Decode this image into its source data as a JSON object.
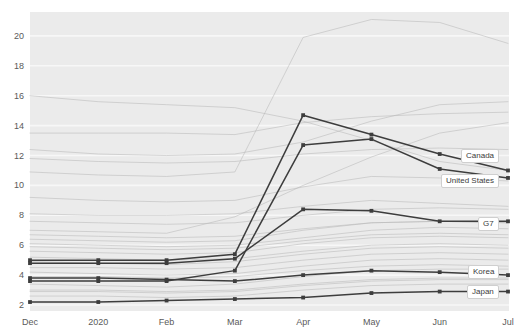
{
  "chart_data": {
    "type": "line",
    "title": "",
    "xlabel": "",
    "ylabel": "",
    "x": [
      "Dec",
      "2020",
      "Feb",
      "Mar",
      "Apr",
      "May",
      "Jun",
      "Jul"
    ],
    "xtick_labels": [
      "Dec",
      "2020",
      "Feb",
      "Mar",
      "Apr",
      "May",
      "Jun",
      "Jul"
    ],
    "ytick_labels": [
      "2",
      "4",
      "6",
      "8",
      "10",
      "12",
      "14",
      "16",
      "18",
      "20"
    ],
    "ytick_values": [
      2,
      4,
      6,
      8,
      10,
      12,
      14,
      16,
      18,
      20
    ],
    "ylim": [
      1.6,
      21.6
    ],
    "xlim": [
      0,
      7
    ],
    "grid": true,
    "grid_color": "#f7f7f7",
    "plot_background": "#ebebeb",
    "legend_position": "end-of-line",
    "highlight_color": "#3d3d3d",
    "context_color": "#b9b9b9",
    "series": [
      {
        "name": "Canada",
        "highlight": true,
        "label": "Canada",
        "label_y": 12.0,
        "values": [
          5.0,
          5.0,
          5.0,
          5.4,
          14.7,
          13.4,
          12.1,
          11.0
        ]
      },
      {
        "name": "United States",
        "highlight": true,
        "label": "United States",
        "label_y": 10.3,
        "values": [
          3.6,
          3.6,
          3.6,
          4.3,
          12.7,
          13.1,
          11.1,
          10.5
        ]
      },
      {
        "name": "G7",
        "highlight": true,
        "label": "G7",
        "label_y": 7.4,
        "values": [
          4.8,
          4.8,
          4.8,
          5.1,
          8.4,
          8.3,
          7.6,
          7.6
        ]
      },
      {
        "name": "Korea",
        "highlight": true,
        "label": "Korea",
        "label_y": 4.2,
        "values": [
          3.8,
          3.8,
          3.7,
          3.6,
          4.0,
          4.3,
          4.2,
          4.0
        ]
      },
      {
        "name": "Japan",
        "highlight": true,
        "label": "Japan",
        "label_y": 2.9,
        "values": [
          2.2,
          2.2,
          2.3,
          2.4,
          2.5,
          2.8,
          2.9,
          2.9
        ]
      },
      {
        "name": "context-01",
        "highlight": false,
        "values": [
          16.0,
          15.6,
          15.4,
          15.2,
          14.3,
          13.0,
          11.6,
          11.0
        ]
      },
      {
        "name": "context-02",
        "highlight": false,
        "values": [
          13.5,
          13.5,
          13.5,
          13.4,
          14.2,
          14.6,
          14.8,
          14.9
        ]
      },
      {
        "name": "context-03",
        "highlight": false,
        "values": [
          12.4,
          12.1,
          12.0,
          12.1,
          12.9,
          14.3,
          15.4,
          15.6
        ]
      },
      {
        "name": "context-04",
        "highlight": false,
        "values": [
          10.9,
          10.7,
          10.6,
          10.9,
          19.9,
          21.1,
          20.9,
          19.5
        ]
      },
      {
        "name": "context-05",
        "highlight": false,
        "values": [
          9.2,
          9.0,
          8.9,
          9.0,
          9.9,
          10.6,
          10.5,
          10.3
        ]
      },
      {
        "name": "context-06",
        "highlight": false,
        "values": [
          8.1,
          8.0,
          8.0,
          8.1,
          8.6,
          9.0,
          8.8,
          8.6
        ]
      },
      {
        "name": "context-07",
        "highlight": false,
        "values": [
          7.0,
          6.9,
          6.8,
          7.9,
          10.0,
          11.9,
          13.5,
          14.2
        ]
      },
      {
        "name": "context-08",
        "highlight": false,
        "values": [
          6.4,
          6.3,
          6.2,
          6.3,
          7.0,
          7.5,
          7.6,
          7.5
        ]
      },
      {
        "name": "context-09",
        "highlight": false,
        "values": [
          6.1,
          6.0,
          5.9,
          6.0,
          6.5,
          7.0,
          7.2,
          7.1
        ]
      },
      {
        "name": "context-10",
        "highlight": false,
        "values": [
          5.6,
          5.5,
          5.4,
          5.5,
          6.1,
          6.5,
          6.6,
          6.5
        ]
      },
      {
        "name": "context-11",
        "highlight": false,
        "values": [
          5.2,
          5.1,
          5.0,
          5.1,
          5.6,
          6.0,
          6.1,
          6.0
        ]
      },
      {
        "name": "context-12",
        "highlight": false,
        "values": [
          4.5,
          4.5,
          4.4,
          4.5,
          5.0,
          5.4,
          5.5,
          5.4
        ]
      },
      {
        "name": "context-13",
        "highlight": false,
        "values": [
          4.2,
          4.1,
          4.0,
          4.1,
          4.6,
          5.0,
          5.1,
          5.0
        ]
      },
      {
        "name": "context-14",
        "highlight": false,
        "values": [
          3.9,
          3.9,
          3.8,
          3.9,
          4.3,
          4.6,
          4.7,
          4.6
        ]
      },
      {
        "name": "context-15",
        "highlight": false,
        "values": [
          3.4,
          3.3,
          3.2,
          3.4,
          3.9,
          4.3,
          4.4,
          4.4
        ]
      },
      {
        "name": "context-16",
        "highlight": false,
        "values": [
          3.0,
          3.0,
          2.9,
          3.0,
          3.4,
          3.7,
          3.8,
          3.8
        ]
      },
      {
        "name": "context-17",
        "highlight": false,
        "values": [
          2.6,
          2.6,
          2.5,
          2.6,
          3.0,
          3.3,
          3.4,
          3.4
        ]
      },
      {
        "name": "context-18",
        "highlight": false,
        "values": [
          4.9,
          4.8,
          4.7,
          4.9,
          5.4,
          5.8,
          5.9,
          5.8
        ]
      },
      {
        "name": "context-19",
        "highlight": false,
        "values": [
          7.6,
          7.5,
          7.4,
          7.5,
          8.0,
          8.4,
          8.5,
          8.4
        ]
      },
      {
        "name": "context-20",
        "highlight": false,
        "values": [
          11.8,
          11.6,
          11.5,
          11.6,
          12.1,
          12.4,
          12.5,
          12.4
        ]
      },
      {
        "name": "context-21",
        "highlight": false,
        "values": [
          2.9,
          2.9,
          2.8,
          2.9,
          3.3,
          3.6,
          3.7,
          3.7
        ]
      },
      {
        "name": "context-22",
        "highlight": false,
        "values": [
          6.7,
          6.6,
          6.5,
          6.6,
          7.1,
          7.5,
          7.6,
          7.5
        ]
      },
      {
        "name": "context-23",
        "highlight": false,
        "values": [
          5.9,
          5.8,
          5.7,
          5.8,
          6.3,
          6.7,
          6.8,
          6.7
        ]
      }
    ]
  },
  "axes": {
    "supertitle": ""
  }
}
